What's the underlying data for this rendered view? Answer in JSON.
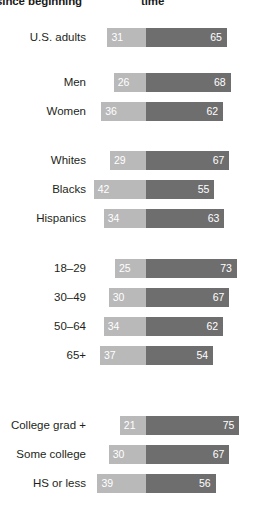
{
  "header": {
    "left_label": "since beginning",
    "right_label": "time"
  },
  "colors": {
    "left_segment": "#b9b9b9",
    "right_segment": "#6e6e6e",
    "value_text": "#ffffff",
    "label_text": "#231f20",
    "background": "#ffffff"
  },
  "chart_data": {
    "type": "bar",
    "subtype": "diverging-stacked-bar",
    "title": "",
    "subtitle": "",
    "xlabel": "",
    "ylabel": "",
    "grid": false,
    "legend_position": "top",
    "axis_note": "Each row is a 100%-style two-segment bar; the split between the light and dark segment is aligned to a common vertical baseline across all rows.",
    "series": [
      {
        "name": "since beginning",
        "color": "#b9b9b9",
        "values": [
          31,
          26,
          36,
          29,
          42,
          34,
          25,
          30,
          34,
          37,
          21,
          30,
          39
        ]
      },
      {
        "name": "time",
        "color": "#6e6e6e",
        "values": [
          65,
          68,
          62,
          67,
          55,
          63,
          73,
          67,
          62,
          54,
          75,
          67,
          56
        ]
      }
    ],
    "categories": [
      "U.S. adults",
      "Men",
      "Women",
      "Whites",
      "Blacks",
      "Hispanics",
      "18–29",
      "30–49",
      "50–64",
      "65+",
      "College grad +",
      "Some college",
      "HS or less"
    ],
    "groups": [
      {
        "name": "",
        "categories": [
          "U.S. adults"
        ]
      },
      {
        "name": "gender",
        "categories": [
          "Men",
          "Women"
        ]
      },
      {
        "name": "race",
        "categories": [
          "Whites",
          "Blacks",
          "Hispanics"
        ]
      },
      {
        "name": "age",
        "categories": [
          "18–29",
          "30–49",
          "50–64",
          "65+"
        ]
      },
      {
        "name": "education",
        "categories": [
          "College grad +",
          "Some college",
          "HS or less"
        ]
      }
    ]
  },
  "rows": [
    {
      "label": "U.S. adults",
      "left": 31,
      "right": 65,
      "top": 26
    },
    {
      "label": "Men",
      "left": 26,
      "right": 68,
      "top": 71
    },
    {
      "label": "Women",
      "left": 36,
      "right": 62,
      "top": 100
    },
    {
      "label": "Whites",
      "left": 29,
      "right": 67,
      "top": 149
    },
    {
      "label": "Blacks",
      "left": 42,
      "right": 55,
      "top": 178
    },
    {
      "label": "Hispanics",
      "left": 34,
      "right": 63,
      "top": 207
    },
    {
      "label": "18–29",
      "left": 25,
      "right": 73,
      "top": 257
    },
    {
      "label": "30–49",
      "left": 30,
      "right": 67,
      "top": 286
    },
    {
      "label": "50–64",
      "left": 34,
      "right": 62,
      "top": 315
    },
    {
      "label": "65+",
      "left": 37,
      "right": 54,
      "top": 344
    },
    {
      "label": "College grad +",
      "left": 21,
      "right": 75,
      "top": 414
    },
    {
      "label": "Some college",
      "left": 30,
      "right": 67,
      "top": 443
    },
    {
      "label": "HS or less",
      "left": 39,
      "right": 56,
      "top": 472
    }
  ]
}
